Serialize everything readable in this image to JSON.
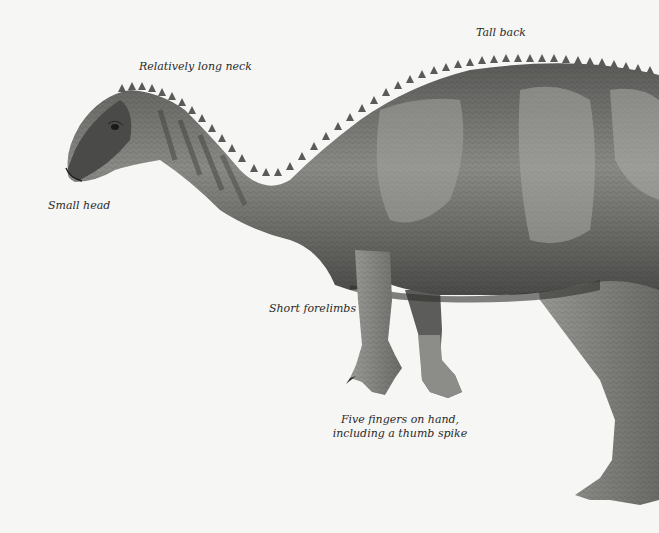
{
  "figure": {
    "background_color": "#f6f6f4",
    "body_color": "#6d6d6b",
    "dark_color": "#3a3a38",
    "light_color": "#b5b5b1"
  },
  "labels": {
    "tall_back": "Tall back",
    "long_neck": "Relatively long neck",
    "small_head": "Small head",
    "short_forelimbs": "Short forelimbs",
    "five_fingers_line1": "Five fingers on hand,",
    "five_fingers_line2": "including a thumb spike"
  }
}
